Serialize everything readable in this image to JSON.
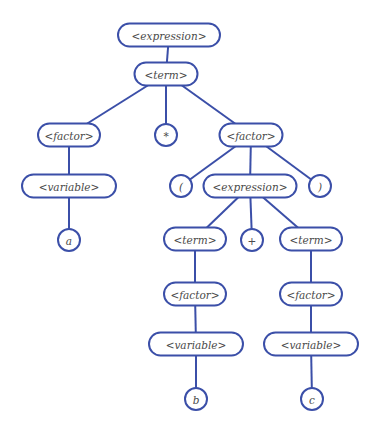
{
  "diagram": {
    "type": "parse-tree",
    "colors": {
      "stroke": "#3b4fa8",
      "text": "#4a4a4a",
      "background": "#ffffff"
    },
    "nodes": [
      {
        "id": "n_expr_root",
        "label": "<expression>",
        "shape": "pill",
        "cx": 169,
        "cy": 35,
        "w": 102,
        "h": 23
      },
      {
        "id": "n_term_root",
        "label": "<term>",
        "shape": "pill",
        "cx": 166,
        "cy": 74,
        "w": 63,
        "h": 23
      },
      {
        "id": "n_factor_l",
        "label": "<factor>",
        "shape": "pill",
        "cx": 69,
        "cy": 135,
        "w": 62,
        "h": 23
      },
      {
        "id": "n_star",
        "label": "*",
        "shape": "circle",
        "cx": 166,
        "cy": 135,
        "r": 11
      },
      {
        "id": "n_factor_r",
        "label": "<factor>",
        "shape": "pill",
        "cx": 251,
        "cy": 135,
        "w": 63,
        "h": 23
      },
      {
        "id": "n_var_l",
        "label": "<variable>",
        "shape": "pill",
        "cx": 69,
        "cy": 186,
        "w": 94,
        "h": 23
      },
      {
        "id": "n_lparen",
        "label": "(",
        "shape": "circle",
        "cx": 181,
        "cy": 186,
        "r": 11
      },
      {
        "id": "n_expr_inner",
        "label": "<expression>",
        "shape": "pill",
        "cx": 250,
        "cy": 186,
        "w": 93,
        "h": 23
      },
      {
        "id": "n_rparen",
        "label": ")",
        "shape": "circle",
        "cx": 320,
        "cy": 186,
        "r": 11
      },
      {
        "id": "n_a",
        "label": "a",
        "shape": "circle",
        "cx": 69,
        "cy": 240,
        "r": 11
      },
      {
        "id": "n_term_b",
        "label": "<term>",
        "shape": "pill",
        "cx": 195,
        "cy": 239,
        "w": 62,
        "h": 23
      },
      {
        "id": "n_plus",
        "label": "+",
        "shape": "circle",
        "cx": 252,
        "cy": 240,
        "r": 11
      },
      {
        "id": "n_term_c",
        "label": "<term>",
        "shape": "pill",
        "cx": 311,
        "cy": 239,
        "w": 62,
        "h": 23
      },
      {
        "id": "n_factor_b",
        "label": "<factor>",
        "shape": "pill",
        "cx": 195,
        "cy": 294,
        "w": 62,
        "h": 23
      },
      {
        "id": "n_factor_c",
        "label": "<factor>",
        "shape": "pill",
        "cx": 311,
        "cy": 294,
        "w": 62,
        "h": 23
      },
      {
        "id": "n_var_b",
        "label": "<variable>",
        "shape": "pill",
        "cx": 196,
        "cy": 344,
        "w": 94,
        "h": 23
      },
      {
        "id": "n_var_c",
        "label": "<variable>",
        "shape": "pill",
        "cx": 311,
        "cy": 344,
        "w": 94,
        "h": 23
      },
      {
        "id": "n_b",
        "label": "b",
        "shape": "circle",
        "cx": 196,
        "cy": 399,
        "r": 11
      },
      {
        "id": "n_c",
        "label": "c",
        "shape": "circle",
        "cx": 312,
        "cy": 399,
        "r": 11
      }
    ],
    "edges": [
      [
        "n_expr_root",
        "n_term_root"
      ],
      [
        "n_term_root",
        "n_factor_l"
      ],
      [
        "n_term_root",
        "n_star"
      ],
      [
        "n_term_root",
        "n_factor_r"
      ],
      [
        "n_factor_l",
        "n_var_l"
      ],
      [
        "n_var_l",
        "n_a"
      ],
      [
        "n_factor_r",
        "n_lparen"
      ],
      [
        "n_factor_r",
        "n_expr_inner"
      ],
      [
        "n_factor_r",
        "n_rparen"
      ],
      [
        "n_expr_inner",
        "n_term_b"
      ],
      [
        "n_expr_inner",
        "n_plus"
      ],
      [
        "n_expr_inner",
        "n_term_c"
      ],
      [
        "n_term_b",
        "n_factor_b"
      ],
      [
        "n_term_c",
        "n_factor_c"
      ],
      [
        "n_factor_b",
        "n_var_b"
      ],
      [
        "n_factor_c",
        "n_var_c"
      ],
      [
        "n_var_b",
        "n_b"
      ],
      [
        "n_var_c",
        "n_c"
      ]
    ]
  }
}
